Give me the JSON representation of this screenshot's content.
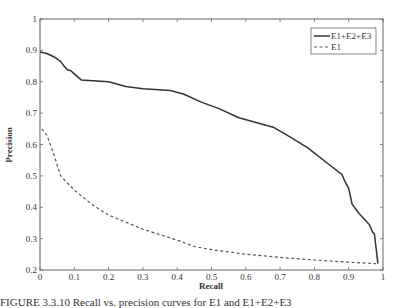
{
  "chart_data": {
    "type": "line",
    "title": "",
    "xlabel": "Recall",
    "ylabel": "Precision",
    "xlim": [
      0,
      1
    ],
    "ylim": [
      0.2,
      1
    ],
    "xticks": [
      "0",
      "0.1",
      "0.2",
      "0.3",
      "0.4",
      "0.5",
      "0.6",
      "0.7",
      "0.8",
      "0.9",
      "1"
    ],
    "yticks": [
      "0.2",
      "0.3",
      "0.4",
      "0.5",
      "0.6",
      "0.7",
      "0.8",
      "0.9",
      "1"
    ],
    "grid": false,
    "legend_position": "upper right",
    "series": [
      {
        "name": "E1+E2+E3",
        "style": "solid",
        "color": "#333333",
        "x": [
          0,
          0.02,
          0.04,
          0.06,
          0.07,
          0.08,
          0.09,
          0.1,
          0.12,
          0.2,
          0.25,
          0.3,
          0.38,
          0.42,
          0.47,
          0.52,
          0.58,
          0.68,
          0.72,
          0.78,
          0.85,
          0.88,
          0.89,
          0.9,
          0.91,
          0.93,
          0.96,
          0.97,
          0.975,
          0.985
        ],
        "y": [
          0.895,
          0.89,
          0.88,
          0.865,
          0.85,
          0.838,
          0.835,
          0.825,
          0.806,
          0.8,
          0.785,
          0.778,
          0.772,
          0.76,
          0.735,
          0.715,
          0.685,
          0.655,
          0.63,
          0.59,
          0.53,
          0.505,
          0.48,
          0.46,
          0.41,
          0.38,
          0.345,
          0.32,
          0.315,
          0.22
        ]
      },
      {
        "name": "E1",
        "style": "dashed",
        "color": "#555555",
        "x": [
          0.005,
          0.02,
          0.04,
          0.06,
          0.1,
          0.15,
          0.2,
          0.3,
          0.4,
          0.45,
          0.5,
          0.6,
          0.7,
          0.8,
          0.9,
          0.98
        ],
        "y": [
          0.65,
          0.63,
          0.57,
          0.5,
          0.455,
          0.41,
          0.375,
          0.33,
          0.295,
          0.275,
          0.265,
          0.25,
          0.24,
          0.232,
          0.225,
          0.22
        ]
      }
    ]
  },
  "caption": "FIGURE 3.3.10 Recall vs. precision curves for E1 and E1+E2+E3"
}
